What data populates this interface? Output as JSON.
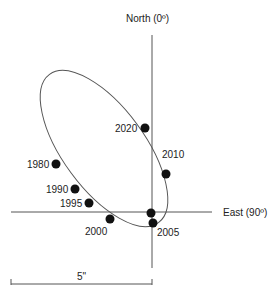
{
  "axes": {
    "north_label": "North (0º)",
    "east_label": "East (90º)"
  },
  "scale_bar": {
    "label": "5\""
  },
  "orbit": {
    "points": [
      {
        "year": "1980",
        "x": 56,
        "y": 164
      },
      {
        "year": "1990",
        "x": 75,
        "y": 189
      },
      {
        "year": "1995",
        "x": 89,
        "y": 203
      },
      {
        "year": "2000",
        "x": 110,
        "y": 219
      },
      {
        "year": "",
        "x": 151,
        "y": 213
      },
      {
        "year": "2005",
        "x": 153,
        "y": 223
      },
      {
        "year": "2010",
        "x": 166,
        "y": 174
      },
      {
        "year": "2020",
        "x": 145,
        "y": 128
      }
    ]
  },
  "labels": {
    "y1980": "1980",
    "y1990": "1990",
    "y1995": "1995",
    "y2000": "2000",
    "y2005": "2005",
    "y2010": "2010",
    "y2020": "2020"
  },
  "colors": {
    "line": "#555555",
    "dot": "#111111",
    "text": "#222222"
  }
}
